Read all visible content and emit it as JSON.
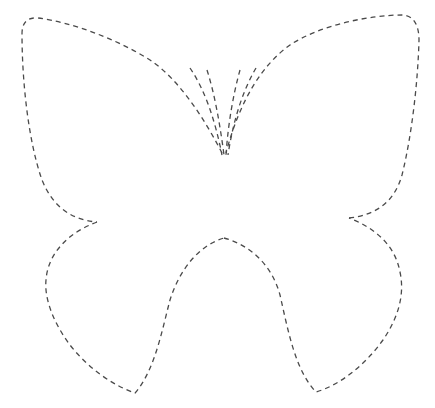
{
  "figure": {
    "title": "Butterfly dashed outline template",
    "subject": "butterfly",
    "style": "dashed-line cut-out template",
    "colors": {
      "background": "#ffffff",
      "stroke": "#4a4a4a"
    },
    "parts": [
      "left-upper-wing",
      "right-upper-wing",
      "left-lower-wing",
      "right-lower-wing",
      "left-antennae",
      "right-antennae"
    ]
  }
}
